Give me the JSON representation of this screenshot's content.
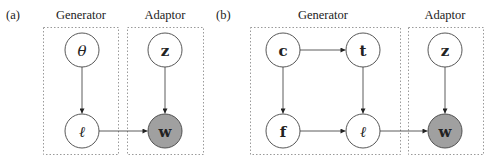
{
  "panels": [
    {
      "id": "a",
      "tag": "(a)",
      "groups": [
        {
          "id": "generator",
          "label": "Generator"
        },
        {
          "id": "adaptor",
          "label": "Adaptor"
        }
      ],
      "nodes": [
        {
          "id": "theta",
          "symbol": "θ",
          "group": "generator",
          "observed": false,
          "italic": true
        },
        {
          "id": "ell",
          "symbol": "ℓ",
          "group": "generator",
          "observed": false,
          "italic": true
        },
        {
          "id": "z",
          "symbol": "z",
          "group": "adaptor",
          "observed": false,
          "italic": false
        },
        {
          "id": "w",
          "symbol": "w",
          "group": "adaptor",
          "observed": true,
          "italic": false
        }
      ],
      "edges": [
        {
          "from": "theta",
          "to": "ell"
        },
        {
          "from": "ell",
          "to": "w"
        },
        {
          "from": "z",
          "to": "w"
        }
      ]
    },
    {
      "id": "b",
      "tag": "(b)",
      "groups": [
        {
          "id": "generator",
          "label": "Generator"
        },
        {
          "id": "adaptor",
          "label": "Adaptor"
        }
      ],
      "nodes": [
        {
          "id": "c",
          "symbol": "c",
          "group": "generator",
          "observed": false,
          "italic": false
        },
        {
          "id": "t",
          "symbol": "t",
          "group": "generator",
          "observed": false,
          "italic": false
        },
        {
          "id": "f",
          "symbol": "f",
          "group": "generator",
          "observed": false,
          "italic": false
        },
        {
          "id": "ell",
          "symbol": "ℓ",
          "group": "generator",
          "observed": false,
          "italic": true
        },
        {
          "id": "z",
          "symbol": "z",
          "group": "adaptor",
          "observed": false,
          "italic": false
        },
        {
          "id": "w",
          "symbol": "w",
          "group": "adaptor",
          "observed": true,
          "italic": false
        }
      ],
      "edges": [
        {
          "from": "c",
          "to": "t"
        },
        {
          "from": "c",
          "to": "f"
        },
        {
          "from": "t",
          "to": "ell"
        },
        {
          "from": "f",
          "to": "ell"
        },
        {
          "from": "ell",
          "to": "w"
        },
        {
          "from": "z",
          "to": "w"
        }
      ]
    }
  ],
  "colors": {
    "observed_fill": "#a0a0a0",
    "node_fill": "#ffffff",
    "stroke": "#444444",
    "group_border": "#9a9a9a"
  }
}
